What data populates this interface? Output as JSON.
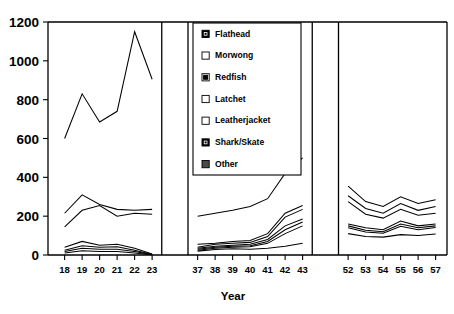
{
  "chart_data": {
    "type": "line",
    "title": "",
    "xlabel": "Year",
    "ylabel": "",
    "grid": false,
    "legend_position": "top-center",
    "ylim": [
      0,
      1200
    ],
    "ytick_labels": [
      "1200",
      "1000",
      "800",
      "600",
      "400",
      "200",
      "0"
    ],
    "ytick_values": [
      1200,
      1000,
      800,
      600,
      400,
      200,
      0
    ],
    "x_panels": [
      {
        "name": "panel-1918-1923",
        "categories": [
          "18",
          "19",
          "20",
          "21",
          "22",
          "23"
        ]
      },
      {
        "name": "panel-1937-1943",
        "categories": [
          "37",
          "38",
          "39",
          "40",
          "41",
          "42",
          "43"
        ]
      },
      {
        "name": "panel-1952-1957",
        "categories": [
          "52",
          "53",
          "54",
          "55",
          "56",
          "57"
        ]
      }
    ],
    "legend": [
      {
        "label": "Flathead",
        "marker": "filled"
      },
      {
        "label": "Morwong",
        "marker": "open"
      },
      {
        "label": "Redfish",
        "marker": "half"
      },
      {
        "label": "Latchet",
        "marker": "open"
      },
      {
        "label": "Leatherjacket",
        "marker": "open"
      },
      {
        "label": "Shark/Skate",
        "marker": "filled"
      },
      {
        "label": "Other",
        "marker": "gray"
      }
    ],
    "series": [
      {
        "name": "Flathead",
        "panels": [
          [
            600,
            830,
            685,
            740,
            1150,
            905
          ],
          [
            200,
            215,
            230,
            250,
            290,
            420,
            500
          ],
          [
            355,
            275,
            250,
            300,
            265,
            285
          ]
        ]
      },
      {
        "name": "Morwong",
        "panels": [
          [
            215,
            310,
            260,
            235,
            230,
            235
          ],
          [
            55,
            60,
            70,
            75,
            110,
            215,
            255
          ],
          [
            305,
            240,
            215,
            265,
            230,
            250
          ]
        ]
      },
      {
        "name": "Redfish",
        "panels": [
          [
            145,
            230,
            255,
            200,
            215,
            210
          ],
          [
            40,
            55,
            60,
            65,
            95,
            195,
            235
          ],
          [
            275,
            210,
            190,
            235,
            205,
            215
          ]
        ]
      },
      {
        "name": "Latchet",
        "panels": [
          [
            40,
            70,
            50,
            55,
            35,
            5
          ],
          [
            35,
            45,
            50,
            55,
            80,
            150,
            185
          ],
          [
            160,
            140,
            130,
            175,
            150,
            160
          ]
        ]
      },
      {
        "name": "Leatherjacket",
        "panels": [
          [
            25,
            48,
            40,
            42,
            25,
            3
          ],
          [
            30,
            40,
            45,
            48,
            70,
            130,
            170
          ],
          [
            150,
            128,
            120,
            160,
            140,
            150
          ]
        ]
      },
      {
        "name": "Shark/Skate",
        "panels": [
          [
            18,
            35,
            30,
            30,
            18,
            2
          ],
          [
            25,
            35,
            40,
            42,
            60,
            110,
            150
          ],
          [
            140,
            118,
            112,
            148,
            130,
            142
          ]
        ]
      },
      {
        "name": "Other",
        "panels": [
          [
            10,
            22,
            18,
            18,
            10,
            1
          ],
          [
            20,
            28,
            32,
            30,
            35,
            45,
            60
          ],
          [
            110,
            95,
            92,
            105,
            100,
            108
          ]
        ]
      }
    ]
  }
}
